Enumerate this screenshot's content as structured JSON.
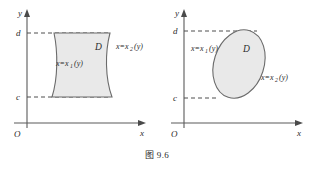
{
  "figure": {
    "caption": "图 9.6",
    "background_color": "#ffffff",
    "region_fill_color": "#e9e9e9",
    "region_stroke_color": "#6b6b6b",
    "axis_color": "#5a5a5a"
  },
  "panels": [
    {
      "id": "left",
      "axes": {
        "y_label": "y",
        "x_label": "x",
        "origin_label": "O"
      },
      "ticks": {
        "upper": "d",
        "lower": "c"
      },
      "region_label": "D",
      "curve_left": {
        "prefix": "x=x",
        "subscript": "1",
        "argument": "(y)"
      },
      "curve_right": {
        "prefix": "x=x",
        "subscript": "2",
        "argument": "(y)"
      },
      "shape": "barrel"
    },
    {
      "id": "right",
      "axes": {
        "y_label": "y",
        "x_label": "x",
        "origin_label": "O"
      },
      "ticks": {
        "upper": "d",
        "lower": "c"
      },
      "region_label": "D",
      "curve_left": {
        "prefix": "x=x",
        "subscript": "1",
        "argument": "(y)"
      },
      "curve_right": {
        "prefix": "x=x",
        "subscript": "2",
        "argument": "(y)"
      },
      "shape": "tilted-ellipse"
    }
  ]
}
